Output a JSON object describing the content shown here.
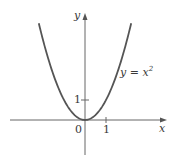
{
  "chart_data": {
    "type": "line",
    "title": "",
    "xlabel": "x",
    "ylabel": "y",
    "function": "y = x^2",
    "annotation": "y = x²",
    "x_ticks": [
      {
        "value": 1,
        "label": "1"
      }
    ],
    "y_ticks": [
      {
        "value": 1,
        "label": "1"
      }
    ],
    "origin_label": "0",
    "xlim": [
      -3.6,
      3.9
    ],
    "ylim": [
      -1.7,
      5.4
    ],
    "grid": false,
    "legend": "none",
    "series": [
      {
        "name": "y = x^2",
        "x": [
          -2.2,
          -2,
          -1.5,
          -1,
          -0.5,
          0,
          0.5,
          1,
          1.5,
          2,
          2.2
        ],
        "y": [
          4.84,
          4,
          2.25,
          1,
          0.25,
          0,
          0.25,
          1,
          2.25,
          4,
          4.84
        ]
      }
    ],
    "colors": {
      "curve": "#555555",
      "axes": "#666666",
      "text": "#3a3a3a"
    }
  },
  "labels": {
    "x_axis": "x",
    "y_axis": "y",
    "origin": "0",
    "x_tick_1": "1",
    "y_tick_1": "1",
    "equation_lhs": "y = x",
    "equation_exp": "2"
  }
}
